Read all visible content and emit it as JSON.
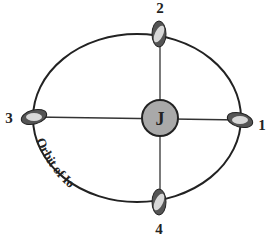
{
  "diagram": {
    "central_body": {
      "label": "J",
      "name": "Jupiter",
      "fill": "#a9a9a9"
    },
    "orbit_label": "Orbit of Io",
    "positions": [
      {
        "id": 1,
        "label": "1"
      },
      {
        "id": 2,
        "label": "2"
      },
      {
        "id": 3,
        "label": "3"
      },
      {
        "id": 4,
        "label": "4"
      }
    ],
    "colors": {
      "moon_dark": "#555555",
      "moon_light": "#d8d8d8",
      "line": "#222222"
    }
  }
}
